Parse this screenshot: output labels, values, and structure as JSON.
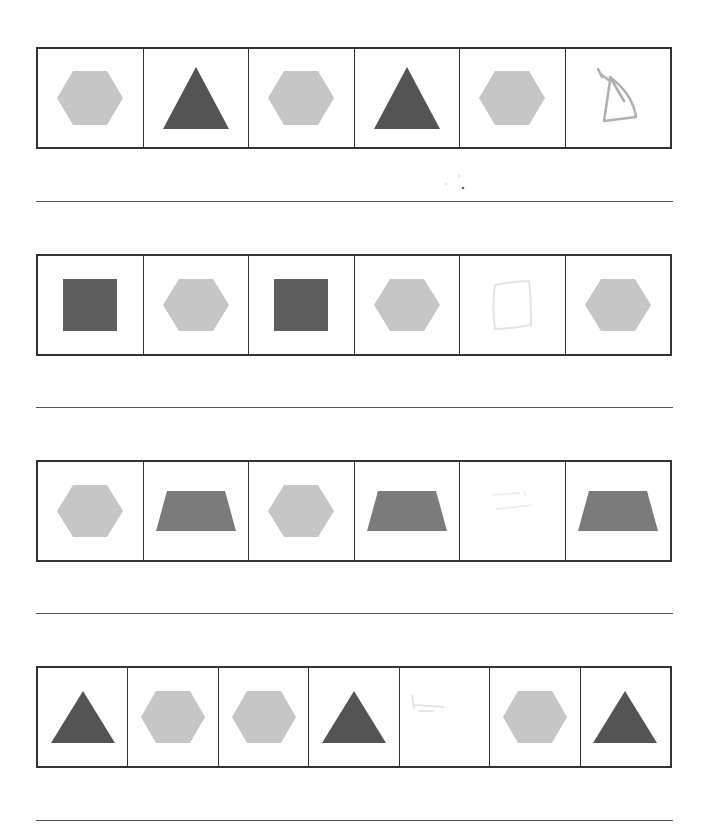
{
  "worksheet": {
    "colors": {
      "hexagon": "#c6c6c6",
      "triangle": "#545454",
      "square": "#5f5f5f",
      "trapezoid": "#7b7b7b",
      "border": "#333333",
      "pencil": "#b0b0b0"
    },
    "rows": [
      {
        "cells": [
          "hexagon",
          "triangle",
          "hexagon",
          "triangle",
          "hexagon",
          "drawn-triangle"
        ],
        "answer_line": ""
      },
      {
        "cells": [
          "square",
          "hexagon",
          "square",
          "hexagon",
          "drawn-square-faint",
          "hexagon"
        ],
        "answer_line": ""
      },
      {
        "cells": [
          "hexagon",
          "trapezoid",
          "hexagon",
          "trapezoid",
          "blank-faint-marks",
          "trapezoid"
        ],
        "answer_line": ""
      },
      {
        "cells": [
          "triangle",
          "hexagon",
          "hexagon",
          "triangle",
          "blank-faint-marks",
          "hexagon",
          "triangle"
        ],
        "answer_line": ""
      }
    ]
  }
}
